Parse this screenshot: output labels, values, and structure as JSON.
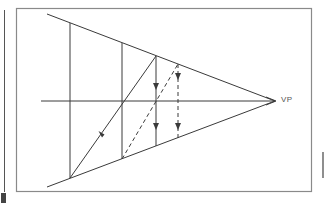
{
  "diagram": {
    "type": "one-point perspective construction",
    "vanishing_point_label": "VP",
    "colors": {
      "line": "#3a3a3a",
      "frame": "#8a8a8a",
      "background": "#ffffff",
      "edge_mark": "#444444"
    },
    "elements": {
      "frame": {
        "x": 16,
        "y": 8,
        "width": 296,
        "height": 184
      },
      "vanishing_point": {
        "x": 275,
        "y": 101
      },
      "horizon_line": {
        "x1": 41,
        "y1": 101,
        "x2": 275,
        "y2": 101
      },
      "top_converging_line": {
        "x1": 47,
        "y1": 14,
        "x2": 275,
        "y2": 101
      },
      "bottom_converging_line": {
        "x1": 47,
        "y1": 187,
        "x2": 275,
        "y2": 101
      },
      "verticals": [
        {
          "name": "vertical-1",
          "x": 70,
          "y1": 23,
          "y2": 178,
          "style": "solid"
        },
        {
          "name": "vertical-2",
          "x": 122,
          "y1": 43,
          "y2": 159,
          "style": "solid"
        },
        {
          "name": "vertical-3",
          "x": 156,
          "y1": 56,
          "y2": 146,
          "style": "solid",
          "arrows": "down"
        },
        {
          "name": "vertical-4",
          "x": 178,
          "y1": 64,
          "y2": 138,
          "style": "dashed",
          "arrows": "down"
        }
      ],
      "diagonals": [
        {
          "name": "solid-diagonal",
          "x1": 70,
          "y1": 178,
          "x2": 156,
          "y2": 56,
          "style": "solid",
          "arrow": "up"
        },
        {
          "name": "dashed-diagonal",
          "x1": 122,
          "y1": 159,
          "x2": 178,
          "y2": 64,
          "style": "dashed"
        }
      ]
    }
  }
}
